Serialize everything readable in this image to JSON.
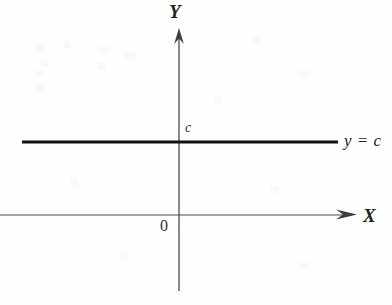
{
  "figure": {
    "title_text": "",
    "background_color": "#fefefe",
    "ink_color": "#2b2b2b",
    "width": 392,
    "height": 305
  },
  "axes": {
    "x": {
      "name": "X",
      "label": "X",
      "origin_label": "0",
      "arrow": "right",
      "line_start_x": 0,
      "line_end_x": 357,
      "line_y": 215,
      "color": "#4a4a4a",
      "stroke_width": 1.1
    },
    "y": {
      "name": "Y",
      "label": "Y",
      "arrow": "up",
      "line_x": 179,
      "line_start_y": 30,
      "line_end_y": 291,
      "color": "#4a4a4a",
      "stroke_width": 1.3
    }
  },
  "annotations": {
    "intercept_label": "c",
    "equation_label": "y = c"
  },
  "chart_data": {
    "type": "line",
    "title": "",
    "xlabel": "X",
    "ylabel": "Y",
    "grid": false,
    "legend": "none",
    "origin_label": "0",
    "axis_arrows": {
      "x": "right",
      "y": "up"
    },
    "series": [
      {
        "name": "y = c",
        "equation": "y = c",
        "kind": "constant-function",
        "intercept_label": "c",
        "color": "#111111",
        "stroke_width": 3,
        "x": [
          22,
          338
        ],
        "y": [
          142,
          142
        ],
        "pixel_y": 142,
        "pixel_x_start": 22,
        "pixel_x_end": 338
      }
    ],
    "annotations": [
      {
        "text": "c",
        "x": 186,
        "y": 128,
        "role": "y-intercept-tick-label"
      },
      {
        "text": "y = c",
        "x": 345,
        "y": 143,
        "role": "curve-equation-label"
      },
      {
        "text": "0",
        "x": 164,
        "y": 226,
        "role": "origin-label"
      },
      {
        "text": "X",
        "x": 370,
        "y": 216,
        "role": "x-axis-name"
      },
      {
        "text": "Y",
        "x": 177,
        "y": 12,
        "role": "y-axis-name"
      }
    ]
  }
}
